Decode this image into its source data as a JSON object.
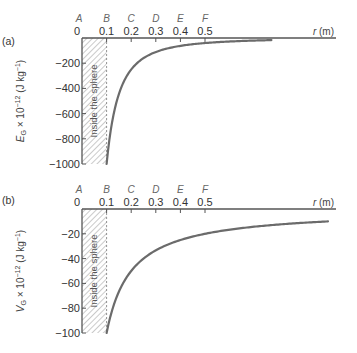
{
  "chart_data": [
    {
      "type": "line",
      "panel": "(a)",
      "title": "",
      "xlabel": "r (m)",
      "ylabel": "E_G × 10^-12 (J kg^-1)",
      "x_ticks": [
        0,
        0.1,
        0.2,
        0.3,
        0.4,
        0.5
      ],
      "x_tick_labels": [
        "0",
        "0.1",
        "0.2",
        "0.3",
        "0.4",
        "0.5"
      ],
      "point_labels": [
        "A",
        "B",
        "C",
        "D",
        "E",
        "F"
      ],
      "y_ticks": [
        -200,
        -400,
        -600,
        -800,
        -1000
      ],
      "y_tick_labels": [
        "−200",
        "−400",
        "−600",
        "−800",
        "−1000"
      ],
      "ylim": [
        -1000,
        0
      ],
      "xlim": [
        0,
        1.03
      ],
      "shaded_region": {
        "x_from": 0,
        "x_to": 0.1,
        "label": "Inside the sphere"
      },
      "series": [
        {
          "name": "E_G",
          "formula": "-10 / r^2",
          "x": [
            0.1,
            0.12,
            0.15,
            0.2,
            0.25,
            0.3,
            0.35,
            0.4,
            0.5,
            0.6,
            0.7,
            0.77
          ],
          "values": [
            -1000,
            -694,
            -444,
            -250,
            -160,
            -111,
            -82,
            -63,
            -40,
            -28,
            -20,
            -17
          ]
        }
      ],
      "grid": false,
      "legend": "none"
    },
    {
      "type": "line",
      "panel": "(b)",
      "title": "",
      "xlabel": "r (m)",
      "ylabel": "V_G × 10^-12 (J kg^-1)",
      "x_ticks": [
        0,
        0.1,
        0.2,
        0.3,
        0.4,
        0.5
      ],
      "x_tick_labels": [
        "0",
        "0.1",
        "0.2",
        "0.3",
        "0.4",
        "0.5"
      ],
      "point_labels": [
        "A",
        "B",
        "C",
        "D",
        "E",
        "F"
      ],
      "y_ticks": [
        -20,
        -40,
        -60,
        -80,
        -100
      ],
      "y_tick_labels": [
        "−20",
        "−40",
        "−60",
        "−80",
        "−100"
      ],
      "ylim": [
        -100,
        0
      ],
      "xlim": [
        0,
        1.03
      ],
      "shaded_region": {
        "x_from": 0,
        "x_to": 0.1,
        "label": "Inside the sphere"
      },
      "series": [
        {
          "name": "V_G",
          "formula": "-10 / r",
          "x": [
            0.1,
            0.12,
            0.15,
            0.2,
            0.25,
            0.3,
            0.4,
            0.5,
            0.6,
            0.7,
            0.8,
            0.9,
            1.0
          ],
          "values": [
            -100,
            -83,
            -67,
            -50,
            -40,
            -33,
            -25,
            -20,
            -17,
            -14,
            -12.5,
            -11,
            -10
          ]
        }
      ],
      "grid": false,
      "legend": "none"
    }
  ],
  "panels": [
    {
      "label": "(a)",
      "ylabel_main": "E",
      "ylabel_sub": "G",
      "ylabel_rest": " × 10",
      "ylabel_exp": "−12",
      "ylabel_unit": " (J kg",
      "ylabel_unit_exp": "−1",
      "ylabel_close": ")",
      "xlabel_var": "r",
      "xlabel_unit": " (m)",
      "inside_label": "Inside the sphere",
      "origin_label": "0"
    },
    {
      "label": "(b)",
      "ylabel_main": "V",
      "ylabel_sub": "G",
      "ylabel_rest": " × 10",
      "ylabel_exp": "−12",
      "ylabel_unit": " (J kg",
      "ylabel_unit_exp": "−1",
      "ylabel_close": ")",
      "xlabel_var": "r",
      "xlabel_unit": " (m)",
      "inside_label": "Inside the sphere",
      "origin_label": "0"
    }
  ],
  "colors": {
    "curve": "#6b6b6b",
    "axis": "#555555",
    "hatch": "#8a8a8a",
    "text": "#333333",
    "point_label": "#666666"
  }
}
